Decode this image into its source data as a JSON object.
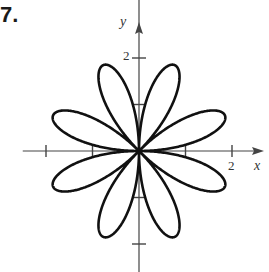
{
  "problem_number": "7.",
  "chart_data": {
    "type": "line",
    "subtype": "polar-rose",
    "title": "",
    "equation_hint": "r = 2 sin(4θ)",
    "petals": 8,
    "max_radius": 2,
    "petal_angles_deg": [
      22.5,
      67.5,
      112.5,
      157.5,
      202.5,
      247.5,
      292.5,
      337.5
    ],
    "xlabel": "x",
    "ylabel": "y",
    "x_ticks": [
      {
        "value": -2,
        "label": ""
      },
      {
        "value": -1,
        "label": ""
      },
      {
        "value": 1,
        "label": ""
      },
      {
        "value": 2,
        "label": "2"
      }
    ],
    "y_ticks": [
      {
        "value": -2,
        "label": ""
      },
      {
        "value": -1,
        "label": ""
      },
      {
        "value": 1,
        "label": ""
      },
      {
        "value": 2,
        "label": "2"
      }
    ],
    "xlim": [
      -2.5,
      2.6
    ],
    "ylim": [
      -2.6,
      3.2
    ],
    "grid": false,
    "legend": null
  },
  "labels": {
    "x_axis": "x",
    "y_axis": "y",
    "x_tick_2": "2",
    "y_tick_2": "2"
  },
  "colors": {
    "curve": "#111111",
    "axes": "#444444"
  },
  "layout": {
    "origin": [
      139,
      151
    ],
    "unit_px": 46.5
  }
}
